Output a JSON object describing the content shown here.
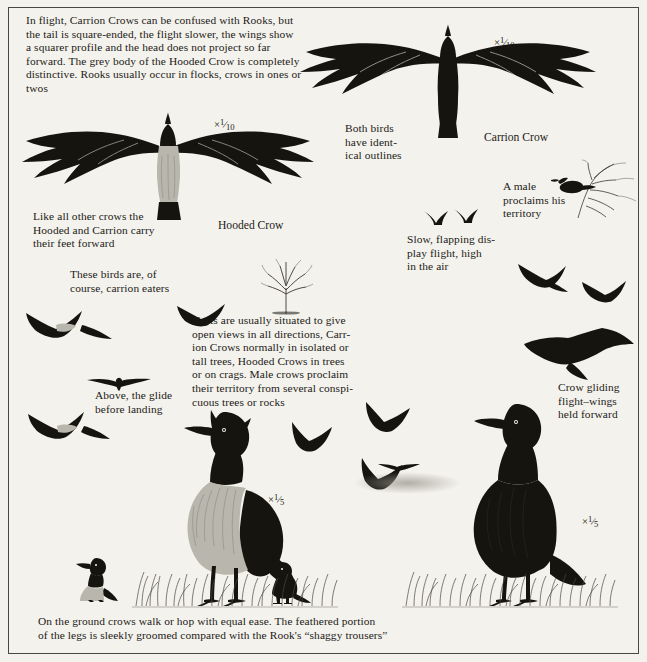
{
  "page": {
    "background_color": "#f4f2ec",
    "ink_color": "#15140f",
    "border_color": "#4a4742"
  },
  "intro": {
    "text": "In flight, Carrion Crows can be confused with Rooks, but\nthe tail is square-ended, the flight slower, the wings show\na squarer profile and the head does not project so far\nforward. The grey body of the Hooded Crow is completely\ndistinctive. Rooks usually occur in flocks, crows in ones or twos"
  },
  "scales": {
    "carrion_flight": {
      "times": "×",
      "numerator": "1",
      "denominator": "10"
    },
    "hooded_flight": {
      "times": "×",
      "numerator": "1",
      "denominator": "10"
    },
    "hooded_standing": {
      "times": "×",
      "numerator": "1",
      "denominator": "5"
    },
    "carrion_standing": {
      "times": "×",
      "numerator": "1",
      "denominator": "5"
    }
  },
  "captions": {
    "both_birds": "Both birds\nhave ident-\nical outlines",
    "carrion_crow_label": "Carrion Crow",
    "hooded_crow_label": "Hooded Crow",
    "feet_forward": "Like all other crows the\nHooded and Carrion carry\ntheir feet forward",
    "carrion_eaters": "These birds are, of\ncourse, carrion eaters",
    "male_proclaims": "A male\nproclaims his\nterritory",
    "display_flight": "Slow, flapping dis-\nplay flight, high\nin the air",
    "nests": "Nests are usually situated to give\nopen views in all directions, Carr-\nion Crows normally in isolated or\ntall trees, Hooded Crows in trees\nor on crags. Male crows proclaim\ntheir territory from several conspi-\ncuous trees or rocks",
    "glide": "Above, the glide\nbefore landing",
    "gliding_flight": "Crow gliding\nflight–wings\nheld forward",
    "bottom": "On the ground crows walk or hop with equal ease. The feathered portion\nof the legs is sleekly groomed compared with the Rook's “shaggy trousers”"
  }
}
